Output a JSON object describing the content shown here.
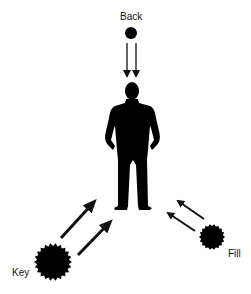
{
  "diagram": {
    "colors": {
      "ink": "#000000",
      "arrow": "#222222",
      "background": "#ffffff"
    },
    "lights": [
      {
        "id": "back",
        "label": "Back",
        "icon": "light-source-dot",
        "position": "top",
        "arrows": 2
      },
      {
        "id": "key",
        "label": "Key",
        "icon": "light-source-burst",
        "position": "bottom-left",
        "arrows": 2
      },
      {
        "id": "fill",
        "label": "Fill",
        "icon": "light-source-burst-small",
        "position": "bottom-right",
        "arrows": 2
      }
    ],
    "subject": {
      "label": "",
      "icon": "person-silhouette"
    }
  }
}
